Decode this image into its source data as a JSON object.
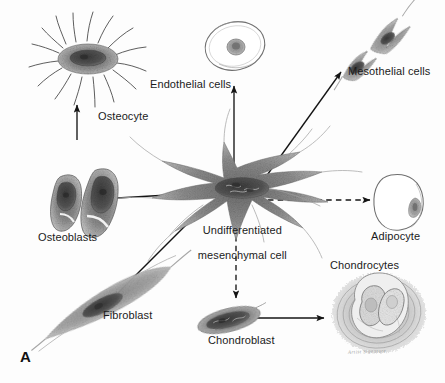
{
  "figure": {
    "panel_letter": "A",
    "signature": "Artist Signature",
    "background_color": "#fdfdfd",
    "ink_color": "#1b1b1b"
  },
  "center_cell": {
    "name": "undifferentiated-mesenchymal-cell",
    "label_line1": "Undifferentiated",
    "label_line2": "mesenchymal cell"
  },
  "cells": [
    {
      "key": "osteocyte",
      "label": "Osteocyte",
      "shape": "stellate-process-cell"
    },
    {
      "key": "osteoblasts",
      "label": "Osteoblasts",
      "shape": "paired-pear-cells"
    },
    {
      "key": "endothelial",
      "label": "Endothelial cells",
      "shape": "flat-oval-cell"
    },
    {
      "key": "mesothelial",
      "label": "Mesothelial cells",
      "shape": "paired-spindle-cells"
    },
    {
      "key": "adipocyte",
      "label": "Adipocyte",
      "shape": "round-clear-cell"
    },
    {
      "key": "fibroblast",
      "label": "Fibroblast",
      "shape": "elongated-spindle-cell"
    },
    {
      "key": "chondroblast",
      "label": "Chondroblast",
      "shape": "flattened-oval-cell"
    },
    {
      "key": "chondrocytes",
      "label": "Chondrocytes",
      "shape": "cells-in-lacuna"
    }
  ],
  "arrows": [
    {
      "key": "to-osteocyte",
      "style": "solid",
      "from": "undifferentiated-mesenchymal-cell",
      "to": "osteocyte"
    },
    {
      "key": "to-osteoblasts",
      "style": "solid",
      "from": "undifferentiated-mesenchymal-cell",
      "to": "osteoblasts"
    },
    {
      "key": "to-endothelial",
      "style": "solid",
      "from": "undifferentiated-mesenchymal-cell",
      "to": "endothelial"
    },
    {
      "key": "to-mesothelial",
      "style": "solid",
      "from": "undifferentiated-mesenchymal-cell",
      "to": "mesothelial"
    },
    {
      "key": "to-adipocyte",
      "style": "dashed",
      "from": "undifferentiated-mesenchymal-cell",
      "to": "adipocyte"
    },
    {
      "key": "to-fibroblast",
      "style": "solid",
      "from": "undifferentiated-mesenchymal-cell",
      "to": "fibroblast"
    },
    {
      "key": "to-chondroblast",
      "style": "dashed",
      "from": "undifferentiated-mesenchymal-cell",
      "to": "chondroblast"
    },
    {
      "key": "to-chondrocytes",
      "style": "solid",
      "from": "chondroblast",
      "to": "chondrocytes"
    }
  ]
}
